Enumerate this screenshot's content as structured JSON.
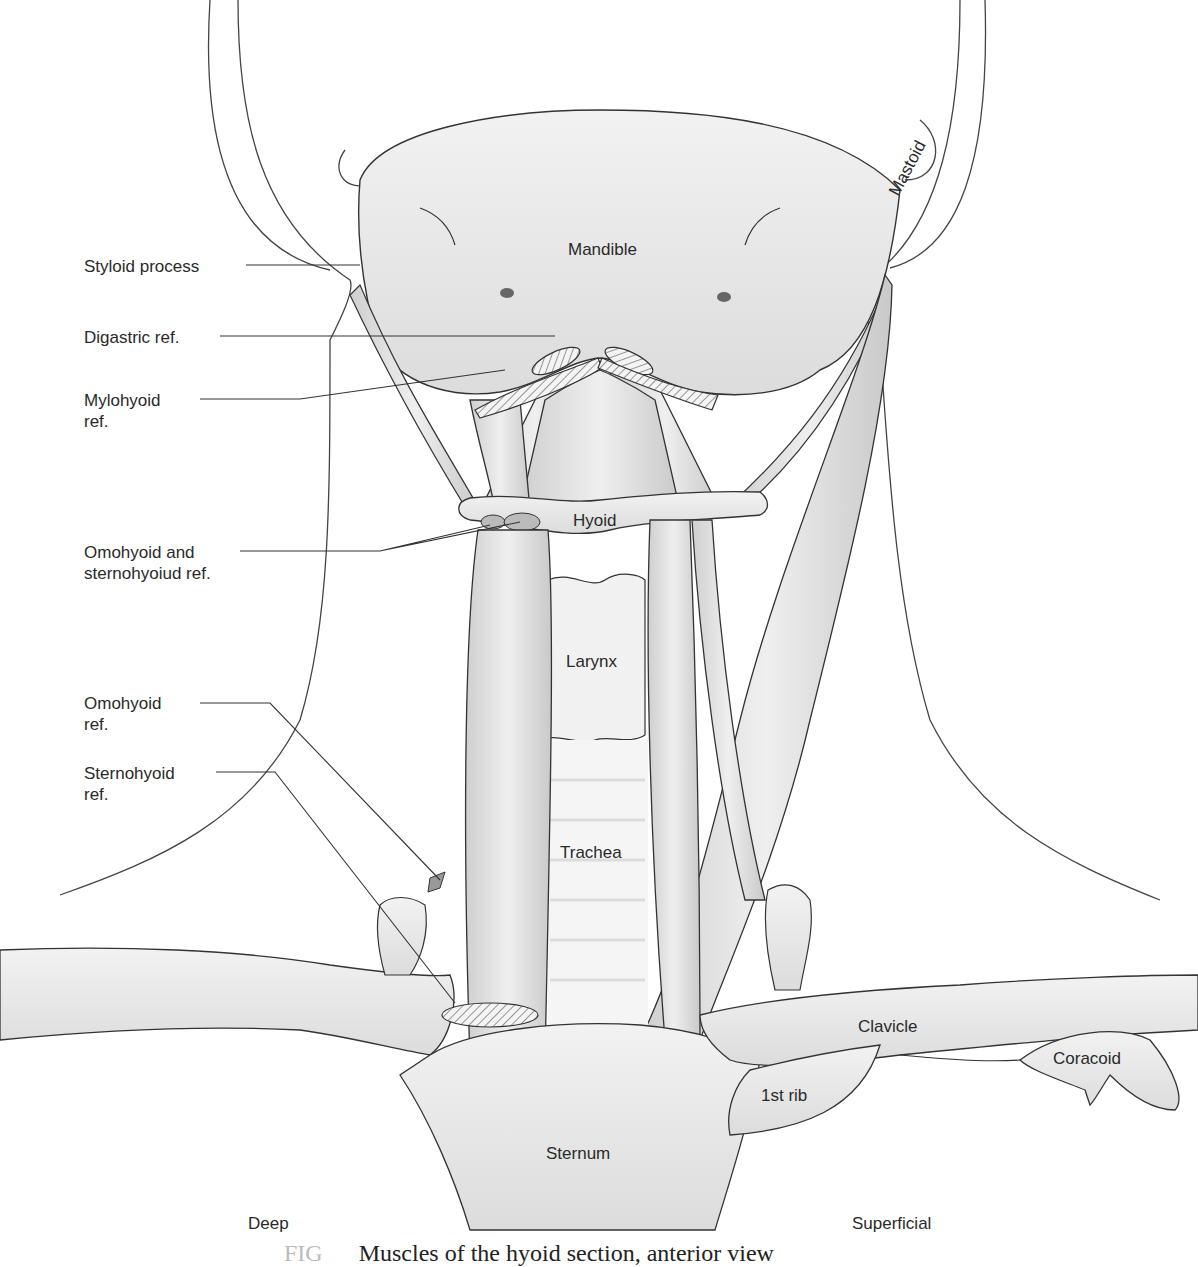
{
  "figure": {
    "caption_number": "FIG",
    "caption": "Muscles of the hyoid section, anterior view",
    "side_labels": {
      "left": "Deep",
      "right": "Superficial"
    },
    "colors": {
      "outline": "#333333",
      "muscle": "#d9d9d9",
      "bone": "#ececec",
      "background": "#ffffff",
      "text": "#2a2a2a"
    }
  },
  "callouts": [
    {
      "id": "styloid",
      "text": "Styloid process"
    },
    {
      "id": "digastric",
      "text": "Digastric ref."
    },
    {
      "id": "mylohyoid",
      "text": "Mylohyoid\nref."
    },
    {
      "id": "omo-sterno",
      "text": "Omohyoid and\nsternohyoiud ref."
    },
    {
      "id": "omohyoid",
      "text": "Omohyoid\nref."
    },
    {
      "id": "sternohyoid",
      "text": "Sternohyoid\nref."
    }
  ],
  "structures": {
    "mandible": "Mandible",
    "mastoid": "Mastoid",
    "hyoid": "Hyoid",
    "larynx": "Larynx",
    "trachea": "Trachea",
    "clavicle": "Clavicle",
    "coracoid": "Coracoid",
    "first_rib": "1st rib",
    "sternum": "Sternum"
  }
}
